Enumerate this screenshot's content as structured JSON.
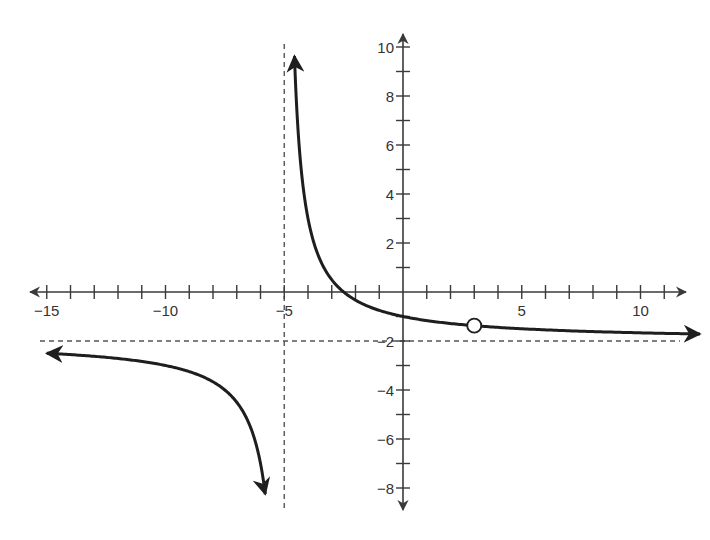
{
  "chart_data": {
    "type": "line",
    "title": "",
    "function": "f(x) = 5/(x+5) - 2",
    "xlabel": "",
    "ylabel": "",
    "xlim": [
      -15.5,
      12
    ],
    "ylim": [
      -9,
      10.5
    ],
    "x_ticks": [
      -15,
      -14,
      -13,
      -12,
      -11,
      -10,
      -9,
      -8,
      -7,
      -6,
      -5,
      -4,
      -3,
      -2,
      -1,
      0,
      1,
      2,
      3,
      4,
      5,
      6,
      7,
      8,
      9,
      10,
      11
    ],
    "x_tick_labels": [
      {
        "value": -15,
        "label": "−15"
      },
      {
        "value": -10,
        "label": "−10"
      },
      {
        "value": -5,
        "label": "−5"
      },
      {
        "value": 5,
        "label": "5"
      },
      {
        "value": 10,
        "label": "10"
      }
    ],
    "y_ticks": [
      -8,
      -7,
      -6,
      -5,
      -4,
      -3,
      -2,
      -1,
      1,
      2,
      3,
      4,
      5,
      6,
      7,
      8,
      9,
      10
    ],
    "y_tick_labels": [
      {
        "value": 10,
        "label": "10"
      },
      {
        "value": 8,
        "label": "8"
      },
      {
        "value": 6,
        "label": "6"
      },
      {
        "value": 4,
        "label": "4"
      },
      {
        "value": 2,
        "label": "2"
      },
      {
        "value": -2,
        "label": "−2"
      },
      {
        "value": -4,
        "label": "−4"
      },
      {
        "value": -6,
        "label": "−6"
      },
      {
        "value": -8,
        "label": "−8"
      }
    ],
    "asymptotes": {
      "vertical": {
        "x": -5,
        "style": "dashed"
      },
      "horizontal": {
        "y": -2,
        "style": "dashed"
      }
    },
    "branches": [
      {
        "name": "left-branch",
        "x_range": [
          -15,
          -5.8
        ],
        "end_arrows": [
          "left",
          "down"
        ]
      },
      {
        "name": "right-branch",
        "x_range": [
          -4.57,
          12.5
        ],
        "end_arrows": [
          "up",
          "right"
        ]
      }
    ],
    "holes": [
      {
        "x": 3,
        "y": -1.375,
        "style": "open-circle"
      }
    ],
    "intercepts": {
      "x": -2.5,
      "y": -1
    },
    "grid": false,
    "legend": null
  },
  "colors": {
    "axis": "#3a3a3a",
    "curve": "#1e1e1e",
    "asymptote": "#555555",
    "background": "#ffffff"
  }
}
